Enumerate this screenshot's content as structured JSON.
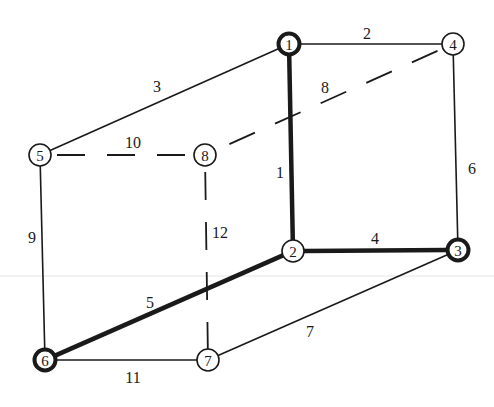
{
  "diagram": {
    "type": "graph",
    "colors": {
      "ink": "#1a1a1a",
      "background": "#ffffff",
      "artifact_line": "#e4e4e4"
    },
    "nodes": [
      {
        "id": "1",
        "label": "1",
        "x": 289,
        "y": 44,
        "bold": true
      },
      {
        "id": "2",
        "label": "2",
        "x": 293,
        "y": 251,
        "bold": false
      },
      {
        "id": "3",
        "label": "3",
        "x": 458,
        "y": 250,
        "bold": true
      },
      {
        "id": "4",
        "label": "4",
        "x": 453,
        "y": 44,
        "bold": false
      },
      {
        "id": "5",
        "label": "5",
        "x": 40,
        "y": 155,
        "bold": false
      },
      {
        "id": "6",
        "label": "6",
        "x": 45,
        "y": 360,
        "bold": true
      },
      {
        "id": "7",
        "label": "7",
        "x": 208,
        "y": 360,
        "bold": false
      },
      {
        "id": "8",
        "label": "8",
        "x": 205,
        "y": 155,
        "bold": false
      }
    ],
    "edges": [
      {
        "label": "1",
        "from": "1",
        "to": "2",
        "style": "bold",
        "lx": 280,
        "ly": 172
      },
      {
        "label": "2",
        "from": "1",
        "to": "4",
        "style": "solid",
        "lx": 367,
        "ly": 33
      },
      {
        "label": "3",
        "from": "1",
        "to": "5",
        "style": "solid",
        "lx": 157,
        "ly": 86
      },
      {
        "label": "4",
        "from": "2",
        "to": "3",
        "style": "bold",
        "lx": 375,
        "ly": 238
      },
      {
        "label": "5",
        "from": "2",
        "to": "6",
        "style": "bold",
        "lx": 150,
        "ly": 302
      },
      {
        "label": "6",
        "from": "4",
        "to": "3",
        "style": "solid",
        "lx": 472,
        "ly": 168
      },
      {
        "label": "7",
        "from": "3",
        "to": "7",
        "style": "solid",
        "lx": 310,
        "ly": 331
      },
      {
        "label": "8",
        "from": "4",
        "to": "8",
        "style": "dashed",
        "lx": 325,
        "ly": 87
      },
      {
        "label": "9",
        "from": "5",
        "to": "6",
        "style": "solid",
        "lx": 32,
        "ly": 237
      },
      {
        "label": "10",
        "from": "5",
        "to": "8",
        "style": "dashed",
        "lx": 133,
        "ly": 142
      },
      {
        "label": "11",
        "from": "6",
        "to": "7",
        "style": "solid",
        "lx": 133,
        "ly": 377
      },
      {
        "label": "12",
        "from": "8",
        "to": "7",
        "style": "dashed",
        "lx": 220,
        "ly": 232
      }
    ]
  }
}
